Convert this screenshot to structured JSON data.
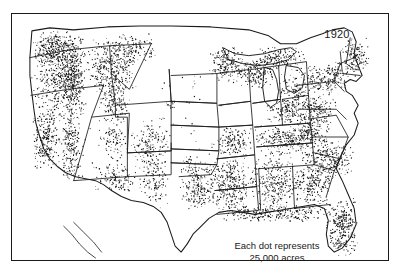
{
  "figure": {
    "kind": "dot-density-map",
    "year_label": "1920",
    "legend": {
      "line1": "Each dot represents",
      "line2": "25,000 acres"
    },
    "colors": {
      "background": "#ffffff",
      "frame": "#1a1a1a",
      "state_border": "#1a1a1a",
      "coastline": "#1a1a1a",
      "dot": "#111111",
      "text": "#1a1a1a"
    },
    "frame": {
      "x": 11,
      "y": 13,
      "width": 378,
      "height": 248,
      "stroke_width": 1.5
    }
  },
  "chart_data": {
    "type": "scatter",
    "title": "1920",
    "subtitle": "Each dot represents 25,000 acres",
    "xlabel": "",
    "ylabel": "",
    "grid": false,
    "legend_position": "bottom-center",
    "unit_per_dot": 25000,
    "unit_name": "acres",
    "xlim": [
      0,
      378
    ],
    "ylim": [
      0,
      248
    ],
    "regions": [
      {
        "name": "Pacific Northwest Coast (WA/OR)",
        "density": "very-high",
        "dot_count": 520,
        "bounds": [
          18,
          18,
          58,
          92
        ],
        "jitter": 1.0
      },
      {
        "name": "Puget Sound / Olympic Peninsula",
        "density": "very-high",
        "dot_count": 210,
        "bounds": [
          22,
          16,
          38,
          34
        ],
        "jitter": 0.9
      },
      {
        "name": "Cascade Range (WA/OR)",
        "density": "very-high",
        "dot_count": 300,
        "bounds": [
          48,
          20,
          26,
          86
        ],
        "jitter": 1.0
      },
      {
        "name": "Northern Idaho / Western Montana",
        "density": "very-high",
        "dot_count": 360,
        "bounds": [
          74,
          22,
          52,
          62
        ],
        "jitter": 1.0
      },
      {
        "name": "Northwest Montana panhandle",
        "density": "high",
        "dot_count": 120,
        "bounds": [
          100,
          20,
          46,
          30
        ],
        "jitter": 1.0
      },
      {
        "name": "California Coast Ranges",
        "density": "high",
        "dot_count": 250,
        "bounds": [
          20,
          92,
          30,
          66
        ],
        "jitter": 1.0
      },
      {
        "name": "Sierra Nevada",
        "density": "high",
        "dot_count": 200,
        "bounds": [
          48,
          96,
          22,
          72
        ],
        "jitter": 1.0
      },
      {
        "name": "Central Idaho mountains",
        "density": "high",
        "dot_count": 150,
        "bounds": [
          86,
          70,
          34,
          40
        ],
        "jitter": 1.0
      },
      {
        "name": "Colorado Rockies",
        "density": "medium-high",
        "dot_count": 170,
        "bounds": [
          118,
          104,
          42,
          56
        ],
        "jitter": 1.0
      },
      {
        "name": "Utah Wasatch / Uinta",
        "density": "medium",
        "dot_count": 90,
        "bounds": [
          86,
          104,
          30,
          46
        ],
        "jitter": 1.0
      },
      {
        "name": "Arizona Mogollon Rim",
        "density": "medium-high",
        "dot_count": 130,
        "bounds": [
          80,
          150,
          48,
          32
        ],
        "jitter": 0.9
      },
      {
        "name": "New Mexico mountains",
        "density": "medium",
        "dot_count": 110,
        "bounds": [
          126,
          140,
          32,
          50
        ],
        "jitter": 1.0
      },
      {
        "name": "Black Hills (SD)",
        "density": "low",
        "dot_count": 16,
        "bounds": [
          152,
          84,
          14,
          14
        ],
        "jitter": 1.0
      },
      {
        "name": "Northern Minnesota",
        "density": "medium-high",
        "dot_count": 200,
        "bounds": [
          196,
          32,
          40,
          38
        ],
        "jitter": 1.0
      },
      {
        "name": "Northern Wisconsin",
        "density": "medium-high",
        "dot_count": 180,
        "bounds": [
          228,
          42,
          36,
          34
        ],
        "jitter": 1.0
      },
      {
        "name": "Michigan Upper Peninsula",
        "density": "high",
        "dot_count": 150,
        "bounds": [
          246,
          32,
          48,
          26
        ],
        "jitter": 1.0
      },
      {
        "name": "Michigan Lower Peninsula",
        "density": "medium",
        "dot_count": 150,
        "bounds": [
          268,
          56,
          34,
          50
        ],
        "jitter": 1.0
      },
      {
        "name": "Maine",
        "density": "medium-high",
        "dot_count": 150,
        "bounds": [
          330,
          22,
          30,
          42
        ],
        "jitter": 1.0
      },
      {
        "name": "Northern New England (NH/VT)",
        "density": "medium",
        "dot_count": 90,
        "bounds": [
          314,
          46,
          24,
          32
        ],
        "jitter": 1.0
      },
      {
        "name": "New York / Adirondacks",
        "density": "medium",
        "dot_count": 130,
        "bounds": [
          290,
          52,
          36,
          34
        ],
        "jitter": 1.0
      },
      {
        "name": "Pennsylvania",
        "density": "medium",
        "dot_count": 130,
        "bounds": [
          288,
          82,
          38,
          28
        ],
        "jitter": 1.0
      },
      {
        "name": "Appalachians (WV/VA)",
        "density": "medium-high",
        "dot_count": 220,
        "bounds": [
          276,
          100,
          48,
          40
        ],
        "jitter": 1.0
      },
      {
        "name": "Carolinas Piedmont & Coast",
        "density": "medium-high",
        "dot_count": 260,
        "bounds": [
          288,
          126,
          56,
          44
        ],
        "jitter": 1.0
      },
      {
        "name": "Tennessee / Kentucky",
        "density": "medium",
        "dot_count": 210,
        "bounds": [
          242,
          110,
          62,
          34
        ],
        "jitter": 1.0
      },
      {
        "name": "Ohio / Indiana",
        "density": "low-medium",
        "dot_count": 110,
        "bounds": [
          252,
          84,
          48,
          28
        ],
        "jitter": 1.0
      },
      {
        "name": "Missouri Ozarks",
        "density": "medium",
        "dot_count": 150,
        "bounds": [
          198,
          114,
          44,
          32
        ],
        "jitter": 1.0
      },
      {
        "name": "Arkansas / Louisiana Delta",
        "density": "high",
        "dot_count": 300,
        "bounds": [
          196,
          142,
          44,
          58
        ],
        "jitter": 1.0
      },
      {
        "name": "East Texas",
        "density": "medium-high",
        "dot_count": 200,
        "bounds": [
          168,
          150,
          36,
          52
        ],
        "jitter": 1.0
      },
      {
        "name": "Mississippi / Alabama",
        "density": "high",
        "dot_count": 300,
        "bounds": [
          238,
          142,
          52,
          58
        ],
        "jitter": 1.0
      },
      {
        "name": "Georgia",
        "density": "medium-high",
        "dot_count": 190,
        "bounds": [
          282,
          152,
          40,
          42
        ],
        "jitter": 1.0
      },
      {
        "name": "Gulf Coast strip",
        "density": "very-high",
        "dot_count": 260,
        "bounds": [
          206,
          192,
          118,
          18
        ],
        "jitter": 0.8
      },
      {
        "name": "Florida peninsula",
        "density": "very-high",
        "dot_count": 300,
        "bounds": [
          316,
          184,
          32,
          62
        ],
        "jitter": 0.9
      },
      {
        "name": "Great Plains (ND/SD/NE/KS)",
        "density": "very-low",
        "dot_count": 34,
        "bounds": [
          146,
          40,
          70,
          120
        ],
        "jitter": 1.0
      },
      {
        "name": "Oklahoma",
        "density": "low",
        "dot_count": 30,
        "bounds": [
          160,
          140,
          44,
          22
        ],
        "jitter": 1.0
      },
      {
        "name": "Great Basin (NV)",
        "density": "very-low",
        "dot_count": 22,
        "bounds": [
          48,
          100,
          36,
          70
        ],
        "jitter": 1.0
      },
      {
        "name": "West Texas",
        "density": "very-low",
        "dot_count": 10,
        "bounds": [
          120,
          166,
          48,
          44
        ],
        "jitter": 1.0
      }
    ]
  }
}
